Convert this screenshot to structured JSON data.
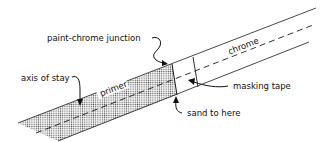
{
  "diagram": {
    "labels": {
      "junction": "paint-chrome junction",
      "chrome": "chrome",
      "axis": "axis of stay",
      "primer": "primer",
      "tape": "masking tape",
      "sand": "sand to here"
    },
    "colors": {
      "line": "#1a1a1a",
      "primer_dots": "#555555",
      "background": "#ffffff"
    }
  }
}
